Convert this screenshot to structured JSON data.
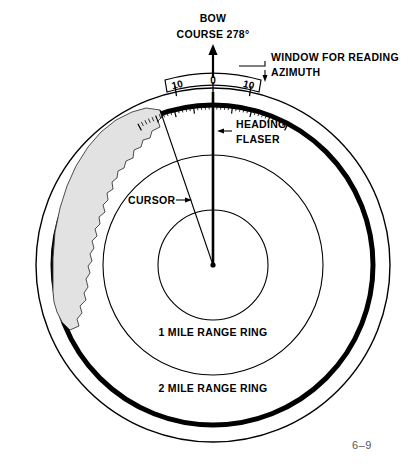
{
  "figure": {
    "name": "radar-ppi-display",
    "page_marker": "6–9",
    "background_color": "#ffffff",
    "ink_color": "#000000",
    "land_fill_color": "#e2e2e2"
  },
  "labels": {
    "bow": "BOW",
    "course": "COURSE 278°",
    "window_line1": "WINDOW FOR READING",
    "window_line2": "AZIMUTH",
    "heading_line1": "HEADING",
    "heading_line2": "FLASER",
    "cursor": "CURSOR",
    "range_ring_1": "1 MILE RANGE RING",
    "range_ring_2": "2 MILE RANGE RING"
  },
  "azimuth_scale": {
    "left_label": "10",
    "center_label": "0",
    "right_label": "10",
    "minor_tick_count": 40
  },
  "geometry": {
    "center_x": 213,
    "center_y": 265,
    "bezel_radius": 177,
    "scope_radius": 160,
    "ring_2_mile_radius": 110,
    "ring_1_mile_radius": 55,
    "sweep_angle_deg": 0,
    "cursor_angle_deg": 341
  }
}
